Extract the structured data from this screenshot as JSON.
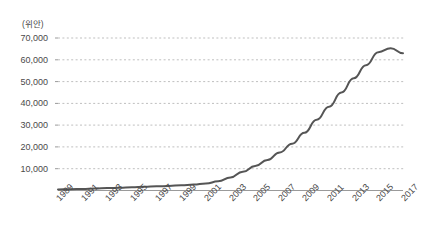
{
  "chart_data": {
    "type": "line",
    "title": "",
    "subtitle": "",
    "unit_label": "(위안)",
    "xlabel": "",
    "ylabel": "",
    "ylim": [
      0,
      70000
    ],
    "ytick_labels": [
      "70,000",
      "60,000",
      "50,000",
      "40,000",
      "30,000",
      "20,000",
      "10,000"
    ],
    "ytick_values": [
      70000,
      60000,
      50000,
      40000,
      30000,
      20000,
      10000
    ],
    "xtick_labels": [
      "1989",
      "1991",
      "1993",
      "1995",
      "1997",
      "1999",
      "2001",
      "2003",
      "2005",
      "2007",
      "2009",
      "2011",
      "2013",
      "2015",
      "2017"
    ],
    "grid": "horizontal-dotted",
    "legend": "none",
    "line_color": "#555555",
    "grid_color": "#bfbfbf",
    "axis_color": "#9a9a9a",
    "x": [
      1989,
      1990,
      1991,
      1992,
      1993,
      1994,
      1995,
      1996,
      1997,
      1998,
      1999,
      2000,
      2001,
      2002,
      2003,
      2004,
      2005,
      2006,
      2007,
      2008,
      2009,
      2010,
      2011,
      2012,
      2013,
      2014,
      2015,
      2016,
      2017
    ],
    "values": [
      500,
      600,
      700,
      900,
      1100,
      1300,
      1500,
      1700,
      1900,
      2100,
      2400,
      2700,
      3200,
      4200,
      6000,
      8600,
      11200,
      14000,
      17500,
      21500,
      26500,
      32500,
      38500,
      45000,
      51500,
      57500,
      63500,
      65300,
      63000
    ],
    "annotations": []
  }
}
